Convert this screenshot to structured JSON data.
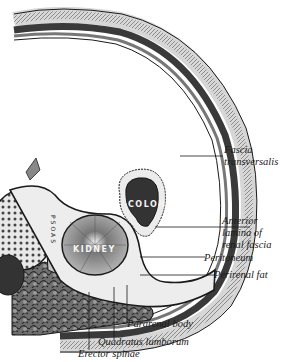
{
  "figure": {
    "type": "anatomical cross-section",
    "organs": {
      "colon": "COLON",
      "kidney": "KIDNEY",
      "psoas": "PSOAS"
    },
    "labels": [
      {
        "id": "fascia_transversalis_1",
        "text": "Fascia"
      },
      {
        "id": "fascia_transversalis_2",
        "text": "transversalis"
      },
      {
        "id": "anterior_lamina_1",
        "text": "Anterior"
      },
      {
        "id": "anterior_lamina_2",
        "text": "lamina of"
      },
      {
        "id": "anterior_lamina_3",
        "text": "renal fascia"
      },
      {
        "id": "peritoneum",
        "text": "Peritoneum"
      },
      {
        "id": "perirenal_fat",
        "text": "Perirenal fat"
      },
      {
        "id": "pararenal_body",
        "text": "Pararenal body"
      },
      {
        "id": "quadratus_lumborum",
        "text": "Quadratus lumborum"
      },
      {
        "id": "erector_spinae",
        "text": "Erector spinae"
      }
    ],
    "colors": {
      "ink": "#1a1a1a",
      "tissue_dark": "#3a3a3a",
      "tissue_mid": "#8a8a8a",
      "tissue_light": "#cfcfcf",
      "background": "#ffffff"
    }
  }
}
